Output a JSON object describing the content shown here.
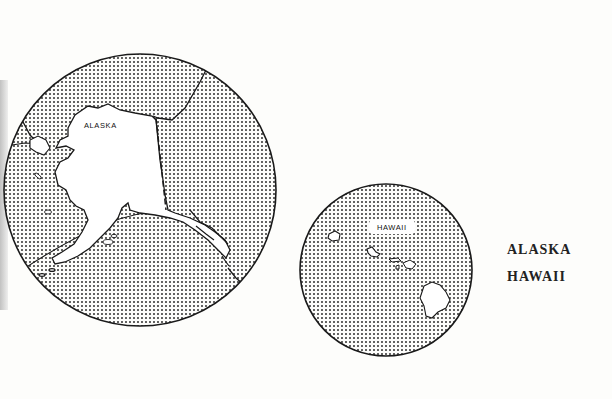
{
  "maps": {
    "alaska": {
      "label": "ALASKA"
    },
    "hawaii": {
      "label": "HAWAII"
    }
  },
  "legend": {
    "items": [
      "ALASKA",
      "HAWAII"
    ]
  },
  "colors": {
    "ocean_dots": "#222222",
    "land": "#ffffff",
    "outline": "#1a1a1a",
    "background": "#fdfdfb"
  }
}
